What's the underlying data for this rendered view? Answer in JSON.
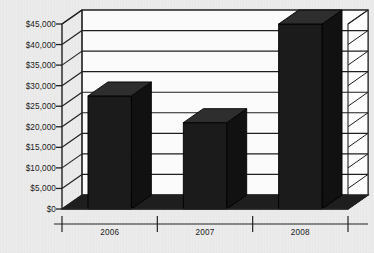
{
  "chart_data": {
    "type": "bar",
    "title": "",
    "subtitle": "",
    "xlabel": "",
    "ylabel": "",
    "categories": [
      "2006",
      "2007",
      "2008"
    ],
    "values": [
      27500,
      21000,
      45000
    ],
    "series": [
      {
        "name": "",
        "values": [
          27500,
          21000,
          45000
        ]
      }
    ],
    "ylim": [
      0,
      45000
    ],
    "ytick_step": 5000,
    "ytick_values": [
      0,
      5000,
      10000,
      15000,
      20000,
      25000,
      30000,
      35000,
      40000,
      45000
    ],
    "ytick_labels": [
      "$0",
      "$5,000",
      "$10,000",
      "$15,000",
      "$20,000",
      "$25,000",
      "$30,000",
      "$35,000",
      "$40,000",
      "$45,000"
    ],
    "grid": true,
    "grid_axis": "y",
    "legend": false,
    "legend_position": "none",
    "three_d": true,
    "bar_color": "#1b1b1b",
    "bar_top_color": "#2e2e2e",
    "bar_side_color": "#111111",
    "plot_background": "#fbfbfb",
    "page_background": "#ececec",
    "axis_color": "#222222",
    "grid_color": "#1f1f1f",
    "annotations": []
  }
}
